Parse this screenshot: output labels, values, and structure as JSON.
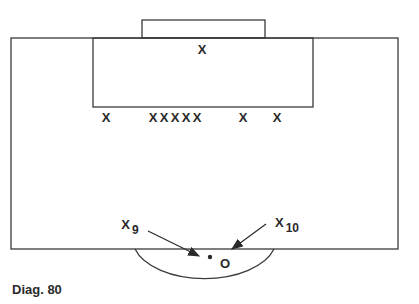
{
  "caption": "Diag. 80",
  "colors": {
    "line": "#3a3a3a",
    "text": "#2a2a2a",
    "background": "#ffffff"
  },
  "pitch": {
    "outer": {
      "x": 11,
      "y": 38,
      "w": 387,
      "h": 211
    },
    "goal": {
      "x": 142,
      "y": 20,
      "w": 123,
      "h": 18
    },
    "penalty_box": {
      "x": 93,
      "y": 38,
      "w": 220,
      "h": 69
    },
    "arc": {
      "x1": 135,
      "x2": 274,
      "y": 249,
      "bottom": 287
    }
  },
  "players": [
    {
      "id": "goalkeeper",
      "label": "X",
      "x": 202,
      "y": 49
    },
    {
      "id": "d1",
      "label": "X",
      "x": 106,
      "y": 117
    },
    {
      "id": "d2",
      "label": "X",
      "x": 153,
      "y": 117
    },
    {
      "id": "d3",
      "label": "X",
      "x": 164,
      "y": 117
    },
    {
      "id": "d4",
      "label": "X",
      "x": 175,
      "y": 117
    },
    {
      "id": "d5",
      "label": "X",
      "x": 186,
      "y": 117
    },
    {
      "id": "d6",
      "label": "X",
      "x": 197,
      "y": 117
    },
    {
      "id": "d7",
      "label": "X",
      "x": 243,
      "y": 117
    },
    {
      "id": "d8",
      "label": "X",
      "x": 277,
      "y": 117
    }
  ],
  "attackers": [
    {
      "label": "X",
      "sub": "9",
      "x": 126,
      "y": 226
    },
    {
      "label": "X",
      "sub": "10",
      "x": 279,
      "y": 223
    }
  ],
  "ball": {
    "x": 210,
    "y": 257
  },
  "opponent_marker": {
    "label": "O",
    "x": 225,
    "y": 263
  },
  "arrows": [
    {
      "from": [
        148,
        231
      ],
      "to": [
        199,
        256
      ]
    },
    {
      "from": [
        266,
        224
      ],
      "to": [
        232,
        249
      ]
    }
  ]
}
